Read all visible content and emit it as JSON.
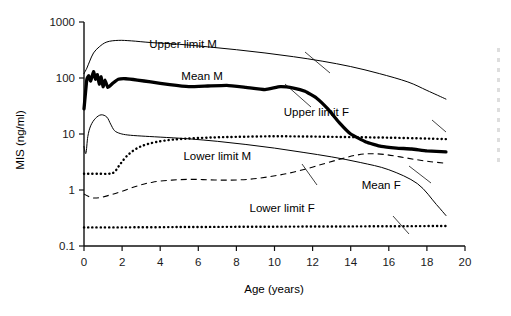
{
  "chart_data": {
    "type": "line",
    "title": "",
    "xlabel": "Age (years)",
    "ylabel": "MIS (ng/ml)",
    "yscale": "log",
    "xlim": [
      0,
      20
    ],
    "ylim": [
      0.1,
      1000
    ],
    "xticks": [
      "0",
      "2",
      "4",
      "6",
      "8",
      "10",
      "12",
      "14",
      "16",
      "18",
      "20"
    ],
    "yticks": [
      "0.1",
      "1",
      "10",
      "100",
      "1000"
    ],
    "grid": false,
    "legend": "inline-annotations",
    "series": [
      {
        "name": "Upper limit M",
        "style": "thin-solid",
        "x": [
          0.0,
          0.15,
          0.3,
          0.5,
          0.8,
          1.2,
          1.8,
          2.5,
          3.5,
          5.0,
          6.5,
          8.0,
          9.5,
          11.0,
          12.5,
          14.0,
          15.5,
          17.0,
          18.0,
          19.0
        ],
        "y": [
          120,
          150,
          200,
          280,
          360,
          440,
          470,
          460,
          430,
          400,
          360,
          320,
          280,
          240,
          200,
          160,
          120,
          85,
          60,
          42
        ]
      },
      {
        "name": "Mean M",
        "style": "thick-solid",
        "x": [
          0.0,
          0.08,
          0.15,
          0.25,
          0.35,
          0.5,
          0.6,
          0.7,
          0.8,
          0.9,
          1.0,
          1.1,
          1.25,
          1.5,
          1.8,
          2.2,
          2.8,
          3.5,
          4.5,
          5.5,
          6.5,
          7.5,
          8.5,
          9.5,
          10.3,
          11.0,
          11.6,
          12.2,
          12.8,
          13.4,
          14.0,
          14.8,
          15.6,
          16.4,
          17.2,
          18.0,
          19.0
        ],
        "y": [
          28,
          55,
          95,
          110,
          88,
          130,
          95,
          115,
          78,
          105,
          70,
          92,
          68,
          80,
          95,
          97,
          92,
          85,
          76,
          70,
          72,
          74,
          68,
          62,
          70,
          66,
          58,
          44,
          28,
          16,
          10,
          7.2,
          6.0,
          5.6,
          5.4,
          5.0,
          4.8
        ]
      },
      {
        "name": "Lower limit M",
        "style": "thin-solid",
        "x": [
          0.0,
          0.1,
          0.2,
          0.35,
          0.6,
          0.9,
          1.2,
          1.4,
          1.6,
          1.9,
          2.3,
          3.0,
          4.0,
          5.5,
          7.0,
          8.5,
          10.0,
          11.5,
          13.0,
          14.5,
          16.0,
          17.5,
          18.5,
          19.0
        ],
        "y": [
          6.0,
          4.5,
          9.0,
          14,
          19,
          22,
          20,
          15,
          11.5,
          10.2,
          9.6,
          9.2,
          8.8,
          8.2,
          7.4,
          6.5,
          5.6,
          4.7,
          3.9,
          3.1,
          2.3,
          1.3,
          0.55,
          0.35
        ]
      },
      {
        "name": "Upper limit F",
        "style": "dotted",
        "x": [
          0.0,
          0.3,
          0.8,
          1.3,
          1.6,
          1.9,
          2.3,
          2.8,
          3.4,
          4.2,
          5.2,
          6.5,
          8.0,
          10.0,
          12.0,
          14.0,
          16.0,
          18.0,
          19.0
        ],
        "y": [
          1.95,
          1.95,
          1.95,
          1.95,
          2.1,
          2.9,
          4.2,
          5.6,
          6.7,
          7.6,
          8.2,
          8.6,
          8.9,
          9.1,
          9.0,
          8.8,
          8.6,
          8.3,
          8.1
        ]
      },
      {
        "name": "Mean F",
        "style": "dashed",
        "x": [
          0.0,
          0.2,
          0.5,
          0.9,
          1.4,
          2.0,
          2.8,
          3.6,
          4.6,
          5.6,
          6.6,
          7.6,
          8.6,
          9.6,
          10.6,
          11.6,
          12.6,
          13.5,
          14.3,
          15.0,
          15.8,
          16.6,
          17.4,
          18.2,
          19.0
        ],
        "y": [
          0.85,
          0.78,
          0.72,
          0.74,
          0.82,
          0.95,
          1.18,
          1.38,
          1.5,
          1.55,
          1.52,
          1.5,
          1.55,
          1.7,
          1.95,
          2.35,
          2.95,
          3.6,
          4.2,
          4.45,
          4.3,
          3.9,
          3.5,
          3.2,
          3.0
        ]
      },
      {
        "name": "Lower limit F",
        "style": "dotted",
        "x": [
          0.0,
          2.0,
          5.0,
          8.0,
          11.0,
          14.0,
          17.0,
          19.0
        ],
        "y": [
          0.215,
          0.215,
          0.218,
          0.22,
          0.222,
          0.224,
          0.226,
          0.228
        ]
      }
    ],
    "annotations": [
      {
        "text": "Upper limit M",
        "x": 5.2,
        "y_px": 48
      },
      {
        "text": "Mean M",
        "x": 6.2,
        "y_px": 80
      },
      {
        "text": "Upper limit F",
        "x": 12.2,
        "y_px": 116
      },
      {
        "text": "Lower limit M",
        "x": 7.0,
        "y_px": 160
      },
      {
        "text": "Mean F",
        "x": 15.6,
        "y_px": 189
      },
      {
        "text": "Lower limit F",
        "x": 10.4,
        "y_px": 212
      }
    ]
  },
  "axes": {
    "x_title": "Age (years)",
    "y_title": "MIS (ng/ml)"
  }
}
